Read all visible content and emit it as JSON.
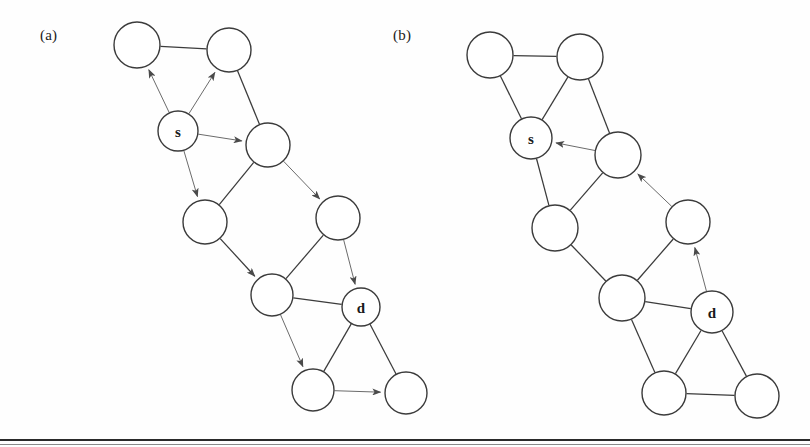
{
  "figure": {
    "panels": [
      {
        "id": "a",
        "label": "(a)",
        "origin": {
          "x": 0,
          "y": 0
        },
        "nodes": [
          {
            "id": "a1",
            "label": "",
            "x": 137,
            "y": 45,
            "r": 23
          },
          {
            "id": "a2",
            "label": "",
            "x": 229,
            "y": 50,
            "r": 22
          },
          {
            "id": "s",
            "label": "s",
            "x": 178,
            "y": 131,
            "r": 20
          },
          {
            "id": "a4",
            "label": "",
            "x": 268,
            "y": 145,
            "r": 22
          },
          {
            "id": "a5",
            "label": "",
            "x": 205,
            "y": 222,
            "r": 22
          },
          {
            "id": "a6",
            "label": "",
            "x": 338,
            "y": 218,
            "r": 22
          },
          {
            "id": "a7",
            "label": "",
            "x": 272,
            "y": 295,
            "r": 21
          },
          {
            "id": "d",
            "label": "d",
            "x": 361,
            "y": 307,
            "r": 19
          },
          {
            "id": "a8",
            "label": "",
            "x": 313,
            "y": 390,
            "r": 21
          },
          {
            "id": "a9",
            "label": "",
            "x": 406,
            "y": 393,
            "r": 21
          }
        ],
        "edges": [
          {
            "from": "a1",
            "to": "a2",
            "arrow": false,
            "weight": "normal"
          },
          {
            "from": "a2",
            "to": "a4",
            "arrow": false,
            "weight": "normal"
          },
          {
            "from": "a4",
            "to": "a5",
            "arrow": false,
            "weight": "normal"
          },
          {
            "from": "a5",
            "to": "a7",
            "arrow": true,
            "weight": "normal"
          },
          {
            "from": "a6",
            "to": "a7",
            "arrow": false,
            "weight": "normal"
          },
          {
            "from": "a7",
            "to": "d",
            "arrow": false,
            "weight": "normal"
          },
          {
            "from": "d",
            "to": "a8",
            "arrow": false,
            "weight": "normal"
          },
          {
            "from": "d",
            "to": "a9",
            "arrow": false,
            "weight": "normal"
          },
          {
            "from": "s",
            "to": "a1",
            "arrow": true,
            "weight": "thin"
          },
          {
            "from": "s",
            "to": "a2",
            "arrow": true,
            "weight": "thin"
          },
          {
            "from": "s",
            "to": "a4",
            "arrow": true,
            "weight": "thin"
          },
          {
            "from": "s",
            "to": "a5",
            "arrow": true,
            "weight": "thin"
          },
          {
            "from": "a4",
            "to": "a6",
            "arrow": true,
            "weight": "thin"
          },
          {
            "from": "a6",
            "to": "d",
            "arrow": true,
            "weight": "thin"
          },
          {
            "from": "a7",
            "to": "a8",
            "arrow": true,
            "weight": "thin"
          },
          {
            "from": "a8",
            "to": "a9",
            "arrow": true,
            "weight": "thin"
          }
        ]
      },
      {
        "id": "b",
        "label": "(b)",
        "origin": {
          "x": 0,
          "y": 0
        },
        "nodes": [
          {
            "id": "b1",
            "label": "",
            "x": 490,
            "y": 55,
            "r": 23
          },
          {
            "id": "b2",
            "label": "",
            "x": 580,
            "y": 57,
            "r": 23
          },
          {
            "id": "s",
            "label": "s",
            "x": 531,
            "y": 138,
            "r": 21
          },
          {
            "id": "b4",
            "label": "",
            "x": 618,
            "y": 155,
            "r": 23
          },
          {
            "id": "b5",
            "label": "",
            "x": 555,
            "y": 228,
            "r": 23
          },
          {
            "id": "b6",
            "label": "",
            "x": 688,
            "y": 222,
            "r": 22
          },
          {
            "id": "b7",
            "label": "",
            "x": 622,
            "y": 298,
            "r": 23
          },
          {
            "id": "d",
            "label": "d",
            "x": 712,
            "y": 312,
            "r": 21
          },
          {
            "id": "b8",
            "label": "",
            "x": 664,
            "y": 393,
            "r": 22
          },
          {
            "id": "b9",
            "label": "",
            "x": 757,
            "y": 396,
            "r": 22
          }
        ],
        "edges": [
          {
            "from": "b1",
            "to": "b2",
            "arrow": false,
            "weight": "normal"
          },
          {
            "from": "b1",
            "to": "s",
            "arrow": false,
            "weight": "normal"
          },
          {
            "from": "b2",
            "to": "s",
            "arrow": false,
            "weight": "normal"
          },
          {
            "from": "b2",
            "to": "b4",
            "arrow": false,
            "weight": "normal"
          },
          {
            "from": "s",
            "to": "b5",
            "arrow": false,
            "weight": "normal"
          },
          {
            "from": "b4",
            "to": "b5",
            "arrow": false,
            "weight": "normal"
          },
          {
            "from": "b5",
            "to": "b7",
            "arrow": false,
            "weight": "normal"
          },
          {
            "from": "b6",
            "to": "b7",
            "arrow": false,
            "weight": "normal"
          },
          {
            "from": "b7",
            "to": "d",
            "arrow": false,
            "weight": "normal"
          },
          {
            "from": "b7",
            "to": "b8",
            "arrow": false,
            "weight": "normal"
          },
          {
            "from": "d",
            "to": "b8",
            "arrow": false,
            "weight": "normal"
          },
          {
            "from": "d",
            "to": "b9",
            "arrow": false,
            "weight": "normal"
          },
          {
            "from": "b8",
            "to": "b9",
            "arrow": false,
            "weight": "normal"
          },
          {
            "from": "b4",
            "to": "s",
            "arrow": true,
            "weight": "thin"
          },
          {
            "from": "b6",
            "to": "b4",
            "arrow": true,
            "weight": "thin"
          },
          {
            "from": "d",
            "to": "b6",
            "arrow": true,
            "weight": "thin"
          }
        ]
      }
    ],
    "colors": {
      "stroke": "#3b3b3b",
      "stroke_thin": "#6b6b6b",
      "node_fill": "#ffffff",
      "text": "#1a1a1a",
      "background": "#fefefe",
      "rule": "#2a2a2a"
    },
    "node_labels_used": [
      "s",
      "d"
    ]
  }
}
